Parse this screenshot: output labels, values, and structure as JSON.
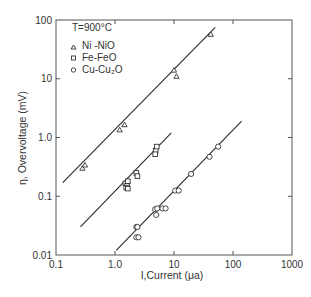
{
  "chart_data": {
    "type": "scatter",
    "title": "",
    "xlabel": "I, Current (μa)",
    "ylabel": "η, Overvoltage (mV)",
    "xscale": "log",
    "yscale": "log",
    "xlim": [
      0.1,
      1000
    ],
    "ylim": [
      0.01,
      100
    ],
    "x_ticks": [
      "0.1",
      "1.0",
      "10",
      "100",
      "1000"
    ],
    "y_ticks": [
      "0.01",
      "0.1",
      "1.0",
      "10",
      "100"
    ],
    "grid": false,
    "legend_title": "T=900°C",
    "legend_position": "upper left",
    "series": [
      {
        "name": "Ni-NiO",
        "marker": "triangle",
        "points": [
          [
            0.28,
            0.3
          ],
          [
            0.31,
            0.34
          ],
          [
            1.2,
            1.35
          ],
          [
            1.45,
            1.65
          ],
          [
            10.0,
            14.0
          ],
          [
            11.0,
            11.0
          ],
          [
            42,
            57
          ]
        ],
        "fit_line": [
          [
            0.13,
            0.17
          ],
          [
            50,
            75
          ]
        ]
      },
      {
        "name": "Fe-FeO",
        "marker": "square",
        "points": [
          [
            1.5,
            0.165
          ],
          [
            1.6,
            0.15
          ],
          [
            1.55,
            0.14
          ],
          [
            1.65,
            0.135
          ],
          [
            1.65,
            0.18
          ],
          [
            2.3,
            0.25
          ],
          [
            2.4,
            0.22
          ],
          [
            4.9,
            0.6
          ],
          [
            5.1,
            0.7
          ],
          [
            4.8,
            0.52
          ]
        ],
        "fit_line": [
          [
            0.26,
            0.03
          ],
          [
            9.0,
            1.2
          ]
        ]
      },
      {
        "name": "Cu-Cu2O",
        "marker": "circle",
        "points": [
          [
            2.3,
            0.03
          ],
          [
            2.4,
            0.03
          ],
          [
            2.3,
            0.02
          ],
          [
            2.5,
            0.02
          ],
          [
            4.8,
            0.06
          ],
          [
            5.2,
            0.062
          ],
          [
            5.0,
            0.048
          ],
          [
            6.4,
            0.062
          ],
          [
            7.2,
            0.062
          ],
          [
            10.5,
            0.125
          ],
          [
            12.0,
            0.125
          ],
          [
            19.5,
            0.24
          ],
          [
            40,
            0.47
          ],
          [
            56,
            0.7
          ]
        ],
        "fit_line": [
          [
            1.05,
            0.012
          ],
          [
            140,
            1.9
          ]
        ]
      }
    ]
  },
  "legend": {
    "title": "T=900°C",
    "items": [
      {
        "label": "Ni -NiO",
        "marker": "triangle"
      },
      {
        "label": "Fe-FeO",
        "marker": "square"
      },
      {
        "label": "Cu-Cu₂O",
        "marker": "circle"
      }
    ]
  },
  "axes": {
    "x_label": "I,Current  (μa)",
    "y_label": "η, Overvoltage (mV)"
  },
  "style": {
    "line_color": "#2a2a2a",
    "axis_color": "#555555",
    "text_color": "#333333"
  }
}
